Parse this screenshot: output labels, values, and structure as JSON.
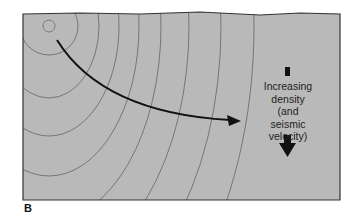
{
  "figure": {
    "panel_label": "B",
    "annotation": {
      "lines": [
        "Increasing",
        "density",
        "(and",
        "seismic",
        "velocity)"
      ]
    },
    "colors": {
      "fill": "#b9b9b9",
      "wavefront": "#6e6e6e",
      "ray": "#111111",
      "border": "#333333"
    },
    "elements": {
      "source": "seismic-source-circle",
      "wavefronts": 10,
      "ray": "curved-ray-arrow",
      "density_arrow": "down-arrow"
    }
  }
}
